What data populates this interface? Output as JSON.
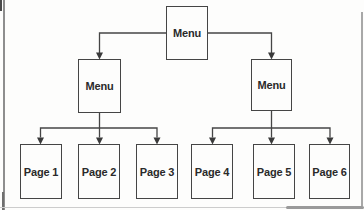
{
  "figure": {
    "background": "#fdfdfc",
    "line_color": "#454545",
    "arrow_color": "#3a3a3a",
    "text_color": "#2a2a2a",
    "frame_line_color": "#8e8e8e"
  },
  "diagram": {
    "type": "hierarchy-flowchart",
    "levels": 3,
    "root": {
      "label": "Menu"
    },
    "menus": [
      {
        "label": "Menu",
        "children": [
          "Page 1",
          "Page 2",
          "Page 3"
        ]
      },
      {
        "label": "Menu",
        "children": [
          "Page 4",
          "Page 5",
          "Page 6"
        ]
      }
    ],
    "pages": [
      {
        "label": "Page 1"
      },
      {
        "label": "Page 2"
      },
      {
        "label": "Page 3"
      },
      {
        "label": "Page 4"
      },
      {
        "label": "Page 5"
      },
      {
        "label": "Page 6"
      }
    ]
  }
}
